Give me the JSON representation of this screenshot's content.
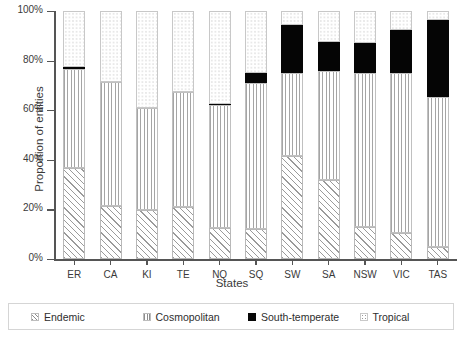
{
  "chart_data": {
    "type": "bar",
    "stacked": true,
    "stack_normalized": true,
    "title": "",
    "xlabel": "States",
    "ylabel": "Proportion of entities",
    "ylim": [
      0,
      100
    ],
    "yticks": [
      "0%",
      "20%",
      "40%",
      "60%",
      "80%",
      "100%"
    ],
    "ytick_values": [
      0,
      20,
      40,
      60,
      80,
      100
    ],
    "grid": false,
    "legend_position": "bottom",
    "categories": [
      "ER",
      "CA",
      "KI",
      "TE",
      "NQ",
      "SQ",
      "SW",
      "SA",
      "NSW",
      "VIC",
      "TAS"
    ],
    "series": [
      {
        "name": "Endemic",
        "pattern": "diagonal-hatch",
        "values": [
          36.7,
          21.4,
          19.8,
          21.0,
          12.5,
          12.1,
          41.5,
          31.8,
          12.9,
          10.5,
          4.8
        ]
      },
      {
        "name": "Cosmopolitan",
        "pattern": "vertical-lines",
        "values": [
          40.0,
          50.0,
          41.1,
          46.4,
          49.5,
          58.9,
          33.5,
          44.2,
          62.1,
          64.5,
          60.5
        ]
      },
      {
        "name": "South-temperate",
        "pattern": "solid-black",
        "values": [
          0.8,
          0.0,
          0.0,
          0.0,
          0.4,
          4.0,
          19.3,
          11.5,
          12.1,
          17.3,
          31.0
        ]
      },
      {
        "name": "Tropical",
        "pattern": "dotted",
        "values": [
          22.5,
          28.6,
          39.1,
          32.6,
          37.6,
          25.0,
          5.7,
          12.5,
          12.9,
          7.7,
          3.7
        ]
      }
    ]
  },
  "legend": {
    "items": [
      {
        "label": "Endemic",
        "swatch": "endemic"
      },
      {
        "label": "Cosmopolitan",
        "swatch": "cosmopolitan"
      },
      {
        "label": "South-temperate",
        "swatch": "southtemperate"
      },
      {
        "label": "Tropical",
        "swatch": "tropical"
      }
    ]
  }
}
